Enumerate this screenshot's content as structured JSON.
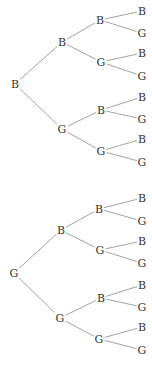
{
  "diagram": {
    "type": "probability-tree",
    "colors": {
      "edge": "#8a8a8a",
      "text": "#333333",
      "background": "#ffffff"
    },
    "trees": [
      {
        "root": {
          "label": "B",
          "x": 15,
          "y": 84
        },
        "level1": [
          {
            "label": "B",
            "x": 62,
            "y": 42
          },
          {
            "label": "G",
            "x": 62,
            "y": 129
          }
        ],
        "level2": [
          {
            "label": "B",
            "x": 100,
            "y": 20,
            "parent": 0
          },
          {
            "label": "G",
            "x": 101,
            "y": 62,
            "parent": 0
          },
          {
            "label": "B",
            "x": 101,
            "y": 110,
            "parent": 1
          },
          {
            "label": "G",
            "x": 101,
            "y": 151,
            "parent": 1
          }
        ],
        "leaves": [
          {
            "label": "B",
            "x": 142,
            "y": 11,
            "parent": 0
          },
          {
            "label": "G",
            "x": 142,
            "y": 33,
            "parent": 0
          },
          {
            "label": "B",
            "x": 142,
            "y": 53,
            "parent": 1
          },
          {
            "label": "G",
            "x": 142,
            "y": 76,
            "parent": 1
          },
          {
            "label": "B",
            "x": 142,
            "y": 97,
            "parent": 2
          },
          {
            "label": "G",
            "x": 142,
            "y": 119,
            "parent": 2
          },
          {
            "label": "B",
            "x": 142,
            "y": 139,
            "parent": 3
          },
          {
            "label": "G",
            "x": 142,
            "y": 162,
            "parent": 3
          }
        ]
      },
      {
        "root": {
          "label": "G",
          "x": 14,
          "y": 273
        },
        "level1": [
          {
            "label": "B",
            "x": 61,
            "y": 230
          },
          {
            "label": "G",
            "x": 60,
            "y": 318
          }
        ],
        "level2": [
          {
            "label": "B",
            "x": 99,
            "y": 209,
            "parent": 0
          },
          {
            "label": "G",
            "x": 100,
            "y": 250,
            "parent": 0
          },
          {
            "label": "B",
            "x": 101,
            "y": 298,
            "parent": 1
          },
          {
            "label": "G",
            "x": 99,
            "y": 339,
            "parent": 1
          }
        ],
        "leaves": [
          {
            "label": "B",
            "x": 142,
            "y": 198,
            "parent": 0
          },
          {
            "label": "G",
            "x": 142,
            "y": 221,
            "parent": 0
          },
          {
            "label": "B",
            "x": 142,
            "y": 241,
            "parent": 1
          },
          {
            "label": "G",
            "x": 142,
            "y": 263,
            "parent": 1
          },
          {
            "label": "B",
            "x": 142,
            "y": 285,
            "parent": 2
          },
          {
            "label": "G",
            "x": 142,
            "y": 307,
            "parent": 2
          },
          {
            "label": "B",
            "x": 142,
            "y": 327,
            "parent": 3
          },
          {
            "label": "G",
            "x": 142,
            "y": 350,
            "parent": 3
          }
        ]
      }
    ]
  }
}
